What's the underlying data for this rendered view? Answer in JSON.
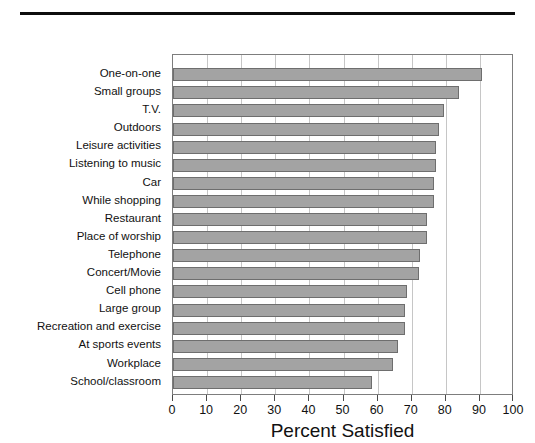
{
  "figure": {
    "top_rule": "horizontal-rule",
    "background_color": "#ffffff"
  },
  "chart_data": {
    "type": "bar",
    "orientation": "horizontal",
    "title": "",
    "xlabel": "Percent Satisfied",
    "ylabel": "",
    "xlim": [
      0,
      100
    ],
    "xticks": [
      0,
      10,
      20,
      30,
      40,
      50,
      60,
      70,
      80,
      90,
      100
    ],
    "xtick_labels": [
      "0",
      "10",
      "20",
      "30",
      "40",
      "50",
      "60",
      "70",
      "80",
      "90",
      "100"
    ],
    "grid": "vertical",
    "legend": "none",
    "bar_color": "#a3a3a3",
    "bar_edge_color": "#6e6e6e",
    "categories": [
      "One-on-one",
      "Small groups",
      "T.V.",
      "Outdoors",
      "Leisure activities",
      "Listening to music",
      "Car",
      "While shopping",
      "Restaurant",
      "Place of worship",
      "Telephone",
      "Concert/Movie",
      "Cell phone",
      "Large group",
      "Recreation and exercise",
      "At sports events",
      "Workplace",
      "School/classroom"
    ],
    "values": [
      90.5,
      84,
      79.5,
      78,
      77,
      77,
      76.5,
      76.5,
      74.5,
      74.5,
      72.5,
      72,
      68.5,
      68,
      68,
      66,
      64.5,
      58.5
    ]
  }
}
